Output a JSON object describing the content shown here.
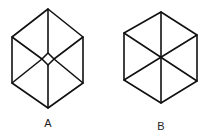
{
  "figures": [
    {
      "label": "A",
      "description": "hexagon with spokes meeting a small central diamond",
      "vertices": [
        [
          48,
          9
        ],
        [
          83,
          37
        ],
        [
          83,
          83
        ],
        [
          48,
          108
        ],
        [
          12,
          83
        ],
        [
          12,
          37
        ]
      ],
      "center_diamond": [
        [
          48,
          53
        ],
        [
          54,
          59
        ],
        [
          48,
          65
        ],
        [
          42,
          59
        ]
      ]
    },
    {
      "label": "B",
      "description": "hexagon with spokes meeting at a single center point",
      "vertices": [
        [
          161,
          12
        ],
        [
          197,
          35
        ],
        [
          197,
          81
        ],
        [
          161,
          103
        ],
        [
          124,
          80
        ],
        [
          124,
          33
        ]
      ],
      "center": [
        161,
        58
      ]
    }
  ],
  "colors": {
    "stroke": "#111111",
    "background": "#ffffff"
  }
}
